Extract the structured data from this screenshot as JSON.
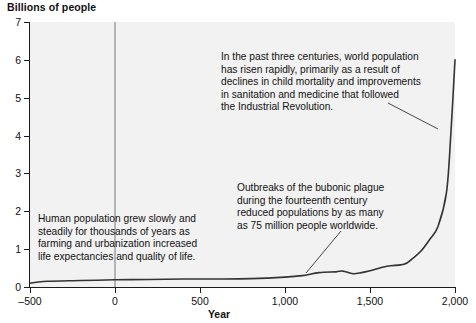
{
  "chart_data": {
    "type": "line",
    "title": "",
    "ylabel": "Billions of people",
    "xlabel": "Year",
    "xlim": [
      -500,
      2000
    ],
    "ylim": [
      0,
      7
    ],
    "grid": false,
    "legend": null,
    "y_ticks": [
      0,
      1,
      2,
      3,
      4,
      5,
      6,
      7
    ],
    "y_tick_labels": [
      "0",
      "1",
      "2",
      "3",
      "4",
      "5",
      "6",
      "7"
    ],
    "x_ticks": [
      -500,
      0,
      500,
      1000,
      1500,
      2000
    ],
    "x_tick_labels": [
      "–500",
      "0",
      "500",
      "1,000",
      "1,500",
      "2,000"
    ],
    "series": [
      {
        "name": "World population",
        "x": [
          -500,
          -400,
          -200,
          0,
          200,
          400,
          600,
          800,
          1000,
          1100,
          1200,
          1300,
          1340,
          1400,
          1450,
          1500,
          1600,
          1700,
          1750,
          1800,
          1850,
          1900,
          1950,
          1975,
          2000
        ],
        "values": [
          0.1,
          0.15,
          0.17,
          0.19,
          0.2,
          0.21,
          0.21,
          0.22,
          0.26,
          0.3,
          0.38,
          0.4,
          0.42,
          0.35,
          0.38,
          0.43,
          0.55,
          0.6,
          0.75,
          0.95,
          1.25,
          1.6,
          2.5,
          4.0,
          6.0
        ]
      }
    ],
    "annotations": [
      {
        "id": "modern",
        "text": "In the past three centuries, world population\nhas risen rapidly, primarily as a result of\ndeclines in child mortality and improvements\nin sanitation and medicine that followed\nthe Industrial Revolution.",
        "leader_from": [
          388,
          103
        ],
        "leader_to": [
          438,
          129
        ]
      },
      {
        "id": "ancient",
        "text": "Human population grew slowly and\nsteadily for thousands of years as\nfarming and urbanization increased\nlife expectancies and quality of life.",
        "leader_from": null,
        "leader_to": null
      },
      {
        "id": "plague",
        "text": "Outbreaks of the bubonic plague\nduring the fourteenth century\nreduced populations by as many\nas 75 million people worldwide.",
        "leader_from": [
          341,
          231
        ],
        "leader_to": [
          306,
          273
        ]
      }
    ],
    "markers": [
      {
        "id": "era-divider",
        "x": 0,
        "color": "#b4b4b4",
        "orientation": "vertical"
      }
    ],
    "colors": {
      "plot_background": "#f2f2f2",
      "page_background": "#ffffff",
      "axis": "#1b1b1b",
      "line": "#333333",
      "era_marker": "#b4b4b4",
      "text": "#111111"
    }
  }
}
